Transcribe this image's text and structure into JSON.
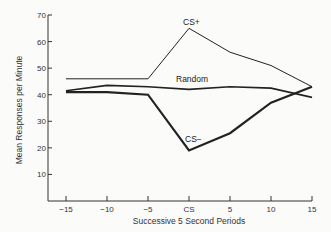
{
  "chart_data": {
    "type": "line",
    "title": "",
    "xlabel": "Successive 5 Second Periods",
    "ylabel": "Mean Responses per Minute",
    "categories": [
      "-15",
      "-10",
      "-5",
      "CS",
      "5",
      "10",
      "15"
    ],
    "ylim": [
      0,
      70
    ],
    "yticks": [
      10,
      20,
      30,
      40,
      50,
      60,
      70
    ],
    "grid": false,
    "legend": "inline labels",
    "series": [
      {
        "name": "CS+",
        "values": [
          46,
          46,
          46,
          65,
          56,
          51,
          43
        ],
        "stroke_width": 1
      },
      {
        "name": "Random",
        "values": [
          41.5,
          43.5,
          43,
          42,
          43,
          42.5,
          39
        ],
        "stroke_width": 1.6
      },
      {
        "name": "CS−",
        "values": [
          41,
          41,
          40,
          19,
          25.5,
          37,
          43
        ],
        "stroke_width": 2.2
      }
    ],
    "series_colors": [
      "#222222",
      "#222222",
      "#222222"
    ]
  }
}
